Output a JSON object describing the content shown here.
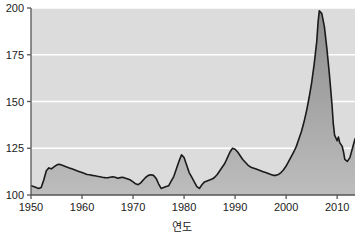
{
  "chart_data": {
    "type": "area",
    "title": "",
    "subtitle": "",
    "xlabel": "연도",
    "ylabel": "",
    "xlim": [
      1950,
      2013.5
    ],
    "ylim": [
      100,
      200
    ],
    "grid": true,
    "legend": false,
    "legend_position": "none",
    "series_name": "주택가격지수",
    "line_color": "#1a1a1a",
    "fill_top_color": "#8d8d8d",
    "fill_bottom_color": "#bdbdbd",
    "plot_background_color": "#dcdcdc",
    "gridline_color": "#ffffff",
    "axis_color": "#555555",
    "x_ticks": [
      1950,
      1960,
      1970,
      1980,
      1990,
      2000,
      2010
    ],
    "x_tick_labels": [
      "1950",
      "1960",
      "1970",
      "1980",
      "1990",
      "2000",
      "2010"
    ],
    "y_ticks": [
      100,
      125,
      150,
      175,
      200
    ],
    "y_tick_labels": [
      "100",
      "125",
      "150",
      "175",
      "200"
    ],
    "annotations": [],
    "x": [
      1950,
      1950.5,
      1951,
      1951.5,
      1952,
      1952.5,
      1953,
      1953.5,
      1954,
      1954.5,
      1955,
      1955.5,
      1956,
      1956.5,
      1957,
      1957.5,
      1958,
      1958.5,
      1959,
      1959.5,
      1960,
      1960.5,
      1961,
      1961.5,
      1962,
      1962.5,
      1963,
      1963.5,
      1964,
      1964.5,
      1965,
      1965.5,
      1966,
      1966.5,
      1967,
      1967.5,
      1968,
      1968.5,
      1969,
      1969.5,
      1970,
      1970.5,
      1971,
      1971.5,
      1972,
      1972.5,
      1973,
      1973.5,
      1974,
      1974.5,
      1975,
      1975.5,
      1976,
      1976.5,
      1977,
      1977.5,
      1978,
      1978.5,
      1979,
      1979.5,
      1980,
      1980.5,
      1981,
      1981.5,
      1982,
      1982.5,
      1983,
      1983.5,
      1984,
      1984.5,
      1985,
      1985.5,
      1986,
      1986.5,
      1987,
      1987.5,
      1988,
      1988.5,
      1989,
      1989.5,
      1990,
      1990.5,
      1991,
      1991.5,
      1992,
      1992.5,
      1993,
      1993.5,
      1994,
      1994.5,
      1995,
      1995.5,
      1996,
      1996.5,
      1997,
      1997.5,
      1998,
      1998.5,
      1999,
      1999.5,
      2000,
      2000.5,
      2001,
      2001.5,
      2002,
      2002.5,
      2003,
      2003.5,
      2004,
      2004.5,
      2005,
      2005.5,
      2006,
      2006.25,
      2006.5,
      2007,
      2007.5,
      2008,
      2008.5,
      2009,
      2009.25,
      2009.5,
      2010,
      2010.25,
      2010.5,
      2011,
      2011.25,
      2011.5,
      2012,
      2012.5,
      2013,
      2013.5
    ],
    "y": [
      105,
      104.5,
      104,
      103.5,
      104,
      108,
      113,
      114.5,
      114,
      115,
      116,
      116.5,
      116,
      115.5,
      115,
      114.5,
      114,
      113.5,
      113,
      112.5,
      112,
      111.5,
      111,
      110.8,
      110.5,
      110.3,
      110,
      109.8,
      109.5,
      109.3,
      109.2,
      109.5,
      109.8,
      109.5,
      109,
      109.3,
      109.5,
      109,
      108.5,
      108,
      107,
      106,
      105.5,
      106.5,
      108,
      109.5,
      110.5,
      110.8,
      110.5,
      109,
      106,
      103.5,
      104,
      104.5,
      105,
      107.5,
      110,
      114,
      118,
      121.5,
      120,
      116,
      112,
      109.5,
      107,
      104.5,
      103.5,
      105.5,
      107,
      107.5,
      108,
      108.5,
      109.5,
      111,
      113,
      115,
      117,
      120,
      123,
      125,
      124.5,
      123,
      121,
      119,
      117.5,
      116,
      115,
      114.5,
      114,
      113.5,
      113,
      112.5,
      112,
      111.5,
      111,
      110.5,
      110.5,
      111,
      112,
      113.5,
      115.5,
      118,
      120.5,
      123,
      126,
      130,
      134,
      139,
      145,
      152,
      160,
      170,
      182,
      192,
      198.5,
      197,
      190,
      178,
      164,
      148,
      138,
      132,
      129,
      131,
      128,
      126,
      123,
      119,
      118,
      120,
      125,
      130
    ]
  }
}
